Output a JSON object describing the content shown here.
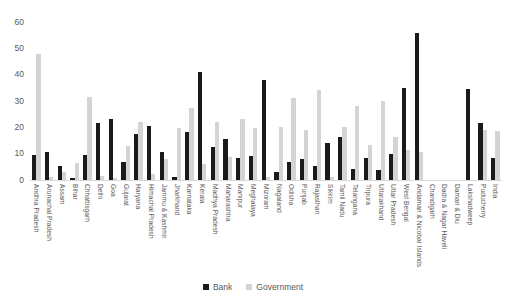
{
  "chart_data": {
    "type": "bar",
    "title": "",
    "subtitle": "",
    "xlabel": "",
    "ylabel": "",
    "ylim": [
      0,
      60
    ],
    "yticks": [
      0,
      10,
      20,
      30,
      40,
      50,
      60
    ],
    "grid": false,
    "legend_position": "bottom-center",
    "colors": {
      "Bank": "#1a1a1a",
      "Government": "#d4d4d4"
    },
    "categories": [
      "Andhra Pradesh",
      "Arunachal Pradesh",
      "Assam",
      "Bihar",
      "Chhattisgarh",
      "Delhi",
      "Goa",
      "Gujarat",
      "Haryana",
      "Himachal Pradesh",
      "Jammu & Kashmir",
      "Jharkhand",
      "Karnataka",
      "Kerala",
      "Madhya Pradesh",
      "Maharashtra",
      "Manipur",
      "Meghalaya",
      "Mizoram",
      "Nagaland",
      "Odisha",
      "Punjab",
      "Rajasthan",
      "Sikkim",
      "Tamil Nadu",
      "Telangana",
      "Tripura",
      "Uttarakhand",
      "Uttar Pradesh",
      "West Bengal",
      "Andaman & Nicobar Islands",
      "Chandigarh",
      "Dadra & Nagar Haveli",
      "Daman & Diu",
      "Lakshadweep",
      "Puducherry",
      "India"
    ],
    "series": [
      {
        "name": "Bank",
        "color": "#1a1a1a",
        "values": [
          9.5,
          10.8,
          5.2,
          0.6,
          9.6,
          21.6,
          23.2,
          7.0,
          17.3,
          20.4,
          10.5,
          1.3,
          18.1,
          41.0,
          12.5,
          15.7,
          8.4,
          9.0,
          37.8,
          3.0,
          7.0,
          8.0,
          5.5,
          14.2,
          16.3,
          4.2,
          8.5,
          3.8,
          9.7,
          34.9,
          55.7,
          0.0,
          0.0,
          0.0,
          34.6,
          21.5,
          8.3
        ]
      },
      {
        "name": "Government",
        "color": "#d4d4d4",
        "values": [
          48.0,
          1.2,
          3.0,
          6.3,
          31.4,
          1.5,
          0.6,
          13.0,
          22.2,
          2.4,
          8.0,
          19.7,
          27.4,
          6.0,
          22.1,
          8.7,
          23.0,
          19.6,
          1.3,
          20.3,
          31.0,
          19.0,
          34.2,
          1.3,
          20.2,
          28.1,
          13.3,
          30.0,
          16.2,
          11.5,
          10.7,
          0.0,
          0.0,
          0.0,
          0.0,
          19.1,
          18.7
        ]
      }
    ]
  },
  "legend": {
    "items": [
      {
        "label": "Bank",
        "color": "#1a1a1a"
      },
      {
        "label": "Government",
        "color": "#d4d4d4"
      }
    ]
  }
}
